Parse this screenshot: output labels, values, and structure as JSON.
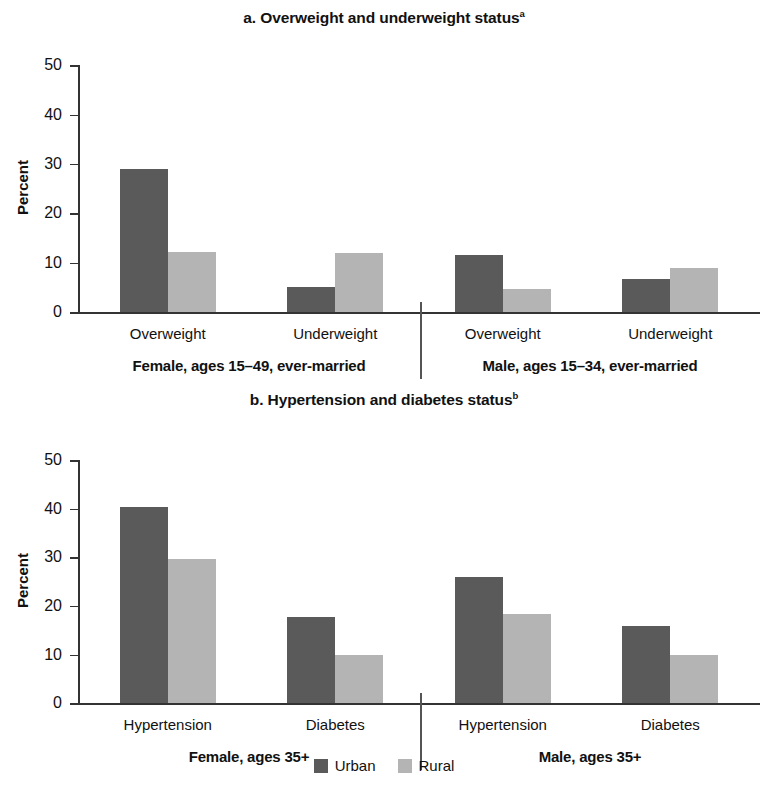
{
  "legend": {
    "items": [
      {
        "label": "Urban",
        "color": "#5a5a5a",
        "key": "urban"
      },
      {
        "label": "Rural",
        "color": "#b4b4b4",
        "key": "rural"
      }
    ]
  },
  "panels": [
    {
      "id": "a",
      "title": "a. Overweight and underweight status",
      "title_superscript": "a",
      "ylabel": "Percent",
      "yticks": [
        "0",
        "10",
        "20",
        "30",
        "40",
        "50"
      ],
      "categories": [
        "Overweight",
        "Underweight",
        "Overweight",
        "Underweight"
      ],
      "groups": [
        "Female, ages 15–49, ever-married",
        "Male, ages 15–34, ever-married"
      ]
    },
    {
      "id": "b",
      "title": "b. Hypertension and diabetes status",
      "title_superscript": "b",
      "ylabel": "Percent",
      "yticks": [
        "0",
        "10",
        "20",
        "30",
        "40",
        "50"
      ],
      "categories": [
        "Hypertension",
        "Diabetes",
        "Hypertension",
        "Diabetes"
      ],
      "groups": [
        "Female, ages 35+",
        "Male, ages 35+"
      ]
    }
  ],
  "chart_data": [
    {
      "type": "bar",
      "title": "a. Overweight and underweight status",
      "title_note": "superscript a",
      "xlabel": "",
      "ylabel": "Percent",
      "ylim": [
        0,
        50
      ],
      "yticks": [
        0,
        10,
        20,
        30,
        40,
        50
      ],
      "grid": false,
      "legend_position": "bottom-center",
      "group_labels": [
        "Female, ages 15–49, ever-married",
        "Male, ages 15–34, ever-married"
      ],
      "categories": [
        "Overweight",
        "Underweight",
        "Overweight",
        "Underweight"
      ],
      "series": [
        {
          "name": "Urban",
          "color": "#5a5a5a",
          "values": [
            29.0,
            5.0,
            11.6,
            6.7
          ]
        },
        {
          "name": "Rural",
          "color": "#b4b4b4",
          "values": [
            12.2,
            11.9,
            4.7,
            9.0
          ]
        }
      ]
    },
    {
      "type": "bar",
      "title": "b. Hypertension and diabetes status",
      "title_note": "superscript b",
      "xlabel": "",
      "ylabel": "Percent",
      "ylim": [
        0,
        50
      ],
      "yticks": [
        0,
        10,
        20,
        30,
        40,
        50
      ],
      "grid": false,
      "legend_position": "bottom-center",
      "group_labels": [
        "Female, ages 35+",
        "Male, ages 35+"
      ],
      "categories": [
        "Hypertension",
        "Diabetes",
        "Hypertension",
        "Diabetes"
      ],
      "series": [
        {
          "name": "Urban",
          "color": "#5a5a5a",
          "values": [
            40.4,
            17.7,
            25.9,
            15.8
          ]
        },
        {
          "name": "Rural",
          "color": "#b4b4b4",
          "values": [
            29.7,
            9.9,
            18.3,
            9.9
          ]
        }
      ]
    }
  ]
}
